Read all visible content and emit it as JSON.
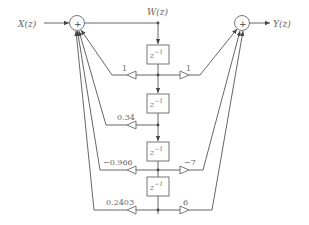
{
  "diagram": {
    "type": "signal-flow",
    "input_label": "X(z)",
    "output_label": "Y(z)",
    "state_label": "W(z)",
    "adder_symbol": "+",
    "delay_label": "z",
    "delay_exp": "−1",
    "delays": 4,
    "feedback_gains": [
      "1",
      "0.34",
      "−0.966",
      "0.2403"
    ],
    "feedforward_gains": [
      "1",
      "−7",
      "6"
    ],
    "line_color": "#555555"
  }
}
